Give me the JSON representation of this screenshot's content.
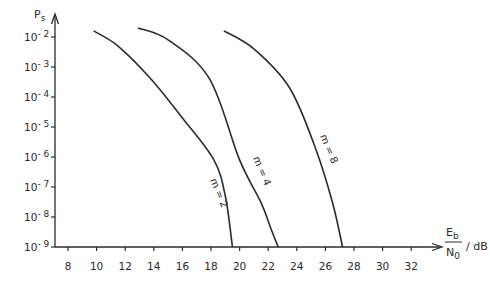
{
  "chart_data": {
    "type": "line",
    "title": "",
    "xlabel": "Eb/N0 / dB",
    "xlabel_parts": {
      "numerator": "E",
      "numerator_sub": "b",
      "denominator": "N",
      "denominator_sub": "0",
      "unit": "/ dB"
    },
    "ylabel": "Ps",
    "ylabel_parts": {
      "main": "P",
      "sub": "s"
    },
    "yscale": "log",
    "xlim": [
      7,
      34
    ],
    "ylim": [
      1e-09,
      0.01
    ],
    "grid": false,
    "x_ticks": [
      8,
      10,
      12,
      14,
      16,
      18,
      20,
      22,
      24,
      26,
      28,
      30,
      32
    ],
    "y_ticks": [
      {
        "base": "10",
        "exp": "- 2",
        "value": 0.01
      },
      {
        "base": "10",
        "exp": "- 3",
        "value": 0.001
      },
      {
        "base": "10",
        "exp": "- 4",
        "value": 0.0001
      },
      {
        "base": "10",
        "exp": "- 5",
        "value": 1e-05
      },
      {
        "base": "10",
        "exp": "- 6",
        "value": 1e-06
      },
      {
        "base": "10",
        "exp": "- 7",
        "value": 1e-07
      },
      {
        "base": "10",
        "exp": "- 8",
        "value": 1e-08
      },
      {
        "base": "10",
        "exp": "- 9",
        "value": 1e-09
      }
    ],
    "series": [
      {
        "name": "m = 2",
        "label": "m = 2",
        "x": [
          9.8,
          11.5,
          13.8,
          16.0,
          18.2,
          19.0,
          19.5
        ],
        "y": [
          0.016,
          0.005,
          0.0004,
          2e-05,
          8e-07,
          5e-08,
          1e-09
        ]
      },
      {
        "name": "m = 4",
        "label": "m = 4",
        "x": [
          12.9,
          15.0,
          17.9,
          20.0,
          21.5,
          22.2,
          22.7
        ],
        "y": [
          0.02,
          0.008,
          0.0004,
          8e-07,
          3e-08,
          4e-09,
          1e-09
        ]
      },
      {
        "name": "m = 8",
        "label": "m = 8",
        "x": [
          18.9,
          21.0,
          23.5,
          25.3,
          26.5,
          27.2
        ],
        "y": [
          0.016,
          0.004,
          0.0002,
          2e-06,
          3e-08,
          1e-09
        ]
      }
    ]
  }
}
